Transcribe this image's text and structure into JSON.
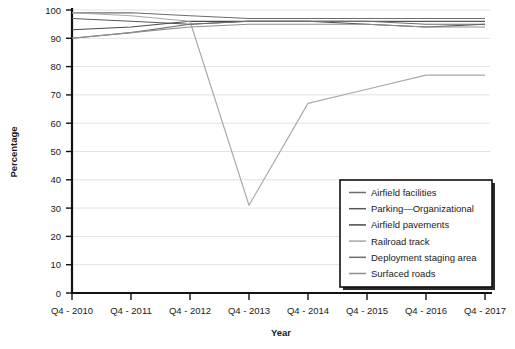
{
  "chart_data": {
    "type": "line",
    "title": "",
    "xlabel": "Year",
    "ylabel": "Percentage",
    "ylim": [
      0,
      100
    ],
    "ytick_values": [
      0,
      10,
      20,
      30,
      40,
      50,
      60,
      70,
      80,
      90,
      100
    ],
    "grid": true,
    "legend_position": "bottom-right",
    "categories": [
      "Q4 - 2010",
      "Q4 - 2011",
      "Q4 - 2012",
      "Q4 - 2013",
      "Q4 - 2014",
      "Q4 - 2015",
      "Q4 - 2016",
      "Q4 - 2017"
    ],
    "series": [
      {
        "name": "Airfield facilities",
        "color": "#6d6d6d",
        "values": [
          99,
          99,
          98,
          97,
          97,
          97,
          97,
          97
        ]
      },
      {
        "name": "Parking—Organizational",
        "color": "#585858",
        "values": [
          97,
          96,
          95,
          96,
          96,
          96,
          96,
          96
        ]
      },
      {
        "name": "Airfield pavements",
        "color": "#4a4a4a",
        "values": [
          93,
          94,
          96,
          96,
          96,
          95,
          94,
          95
        ]
      },
      {
        "name": "Railroad track",
        "color": "#a8a8a8",
        "values": [
          99,
          98,
          96,
          31,
          67,
          72,
          77,
          77
        ]
      },
      {
        "name": "Deployment staging area",
        "color": "#6f6f6f",
        "values": [
          90,
          92,
          95,
          96,
          96,
          96,
          95,
          95
        ]
      },
      {
        "name": "Surfaced roads",
        "color": "#8f8f8f",
        "values": [
          90,
          92,
          94,
          95,
          95,
          95,
          94,
          94
        ]
      }
    ]
  },
  "legend": {
    "entries": [
      {
        "label": "Airfield facilities"
      },
      {
        "label": "Parking—Organizational"
      },
      {
        "label": "Airfield pavements"
      },
      {
        "label": "Railroad track"
      },
      {
        "label": "Deployment staging area"
      },
      {
        "label": "Surfaced roads"
      }
    ]
  }
}
